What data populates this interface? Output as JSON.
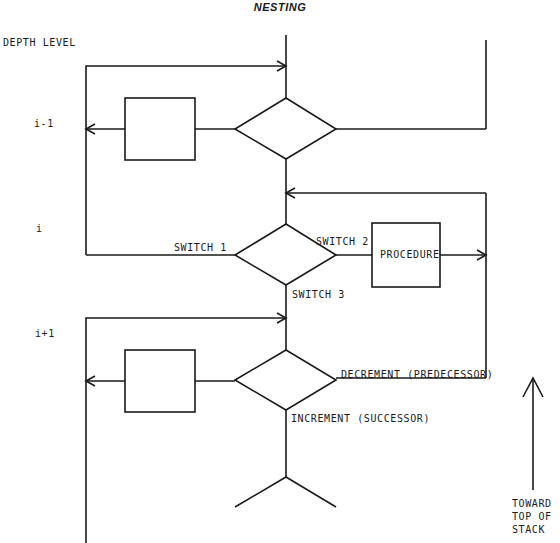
{
  "title": "NESTING",
  "axis_label": "DEPTH LEVEL",
  "levels": [
    {
      "label": "i-1"
    },
    {
      "label": "i"
    },
    {
      "label": "i+1"
    }
  ],
  "switches": {
    "switch1": "SWITCH 1",
    "switch2": "SWITCH 2",
    "switch3": "SWITCH 3"
  },
  "procedure_label": "PROCEDURE",
  "decrement_label": "DECREMENT (PREDECESSOR)",
  "increment_label": "INCREMENT (SUCCESSOR)",
  "direction_label": [
    "TOWARD",
    "TOP OF",
    "STACK"
  ],
  "colors": {
    "ink": "#1a1a1a",
    "background": "#ffffff"
  }
}
